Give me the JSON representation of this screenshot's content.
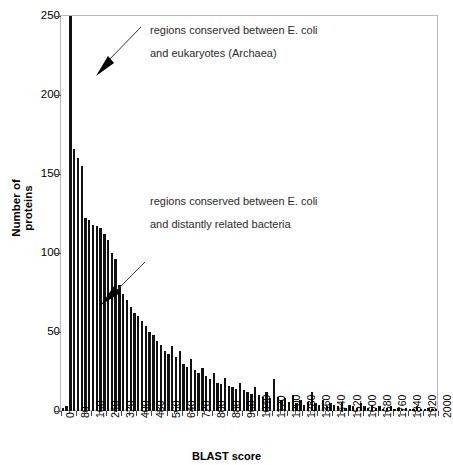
{
  "chart_data": {
    "type": "bar",
    "title": "",
    "xlabel": "BLAST score",
    "ylabel": "Number of proteins",
    "ylabel_lines": [
      "Number of",
      "proteins"
    ],
    "xlim": [
      0,
      2000
    ],
    "ylim": [
      0,
      250
    ],
    "ytick_values": [
      0,
      50,
      100,
      150,
      200,
      250
    ],
    "xtick_values": [
      0,
      80,
      160,
      240,
      320,
      400,
      480,
      560,
      640,
      720,
      800,
      880,
      960,
      1040,
      1120,
      1200,
      1280,
      1360,
      1440,
      1520,
      1600,
      1680,
      1760,
      1840,
      1920,
      2000
    ],
    "bin_width": 20,
    "grid": false,
    "legend": "none",
    "bar_color": "#111111",
    "frame_color": "#b9b9b9",
    "note_clipped_first_bin": "first bin exceeds the 250 axis maximum and is drawn clipped at the top of the plot",
    "categories": [
      10,
      30,
      50,
      70,
      90,
      110,
      130,
      150,
      170,
      190,
      210,
      230,
      250,
      270,
      290,
      310,
      330,
      350,
      370,
      390,
      410,
      430,
      450,
      470,
      490,
      510,
      530,
      550,
      570,
      590,
      610,
      630,
      650,
      670,
      690,
      710,
      730,
      750,
      770,
      790,
      810,
      830,
      850,
      870,
      890,
      910,
      930,
      950,
      970,
      990,
      1010,
      1030,
      1050,
      1070,
      1090,
      1110,
      1130,
      1150,
      1170,
      1190,
      1210,
      1230,
      1250,
      1270,
      1290,
      1310,
      1330,
      1350,
      1370,
      1390,
      1410,
      1430,
      1450,
      1470,
      1490,
      1510,
      1530,
      1550,
      1570,
      1590,
      1610,
      1630,
      1650,
      1670,
      1690,
      1710,
      1730,
      1750,
      1770,
      1790,
      1810,
      1830,
      1850,
      1870,
      1890,
      1910,
      1930,
      1950,
      1970,
      1990
    ],
    "values": [
      2,
      3,
      252,
      166,
      160,
      155,
      122,
      121,
      118,
      117,
      116,
      112,
      108,
      100,
      96,
      80,
      74,
      70,
      66,
      62,
      60,
      57,
      54,
      50,
      48,
      44,
      42,
      38,
      36,
      41,
      34,
      38,
      30,
      28,
      33,
      26,
      24,
      27,
      22,
      20,
      24,
      18,
      17,
      21,
      16,
      15,
      14,
      18,
      13,
      12,
      11,
      15,
      10,
      9,
      12,
      8,
      20,
      9,
      7,
      8,
      6,
      10,
      5,
      7,
      4,
      6,
      12,
      5,
      4,
      7,
      3,
      5,
      4,
      3,
      6,
      2,
      4,
      3,
      2,
      5,
      3,
      2,
      4,
      2,
      3,
      1,
      2,
      3,
      1,
      2,
      1,
      2,
      1,
      1,
      3,
      1,
      1,
      2,
      1,
      1
    ]
  },
  "annotations": [
    {
      "id": "annotation-archaea",
      "line1": "regions conserved between E. coli",
      "line2": "and eukaryotes (Archaea)",
      "arrow": "diagonal-arrow-down-left"
    },
    {
      "id": "annotation-bacteria",
      "line1": "regions conserved between E. coli",
      "line2": "and distantly related bacteria",
      "arrow": "diagonal-arrow-down-left"
    }
  ]
}
